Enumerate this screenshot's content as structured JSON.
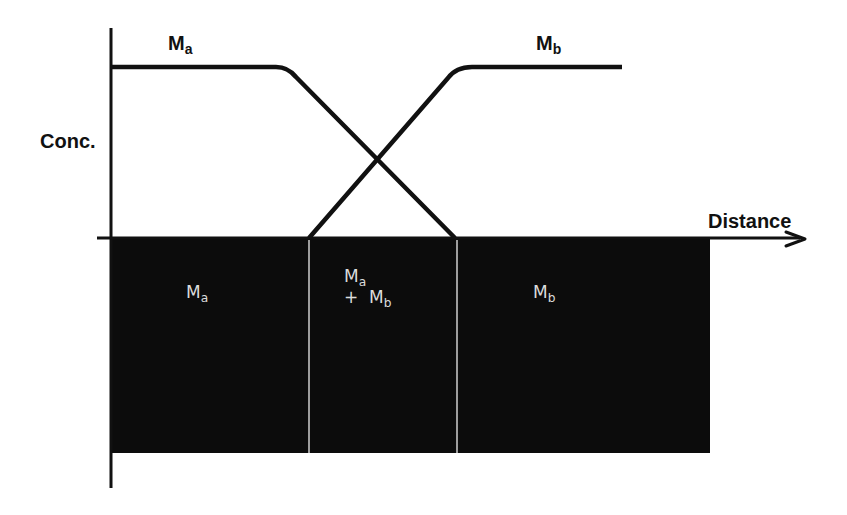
{
  "diagram": {
    "y_axis_label": "Conc.",
    "x_axis_label": "Distance",
    "curves": [
      {
        "name": "Ma",
        "base": "M",
        "sub": "a",
        "description": "Concentration of Ma: high plateau on left, declining to zero across interdiffusion zone"
      },
      {
        "name": "Mb",
        "base": "M",
        "sub": "b",
        "description": "Concentration of Mb: zero on left, rising to high plateau on right"
      }
    ],
    "regions": [
      {
        "name": "Ma",
        "line1_base": "M",
        "line1_sub": "a"
      },
      {
        "name": "Ma + Mb",
        "line1_base": "M",
        "line1_sub": "a",
        "line2_prefix": "+ ",
        "line2_base": "M",
        "line2_sub": "b"
      },
      {
        "name": "Mb",
        "line1_base": "M",
        "line1_sub": "b"
      }
    ],
    "colors": {
      "line": "#111111",
      "block": "#0c0c0c",
      "divider": "#cfcfcf",
      "region_text": "#dcdcdc",
      "background": "#ffffff"
    }
  }
}
